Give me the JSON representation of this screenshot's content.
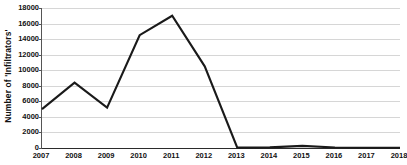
{
  "chart_data": {
    "type": "line",
    "title": "",
    "xlabel": "",
    "ylabel": "Number of 'Infiltrators'",
    "categories": [
      "2007",
      "2008",
      "2009",
      "2010",
      "2011",
      "2012",
      "2013",
      "2014",
      "2015",
      "2016",
      "2017",
      "2018"
    ],
    "values": [
      5000,
      8400,
      5200,
      14500,
      17000,
      10500,
      50,
      80,
      270,
      60,
      30,
      30
    ],
    "series": [
      {
        "name": "Number of 'Infiltrators'",
        "values": [
          5000,
          8400,
          5200,
          14500,
          17000,
          10500,
          50,
          80,
          270,
          60,
          30,
          30
        ]
      }
    ],
    "ylim": [
      0,
      18000
    ],
    "ytick_values": [
      0,
      2000,
      4000,
      6000,
      8000,
      10000,
      12000,
      14000,
      16000,
      18000
    ],
    "ytick_labels": [
      "0",
      "2000",
      "4000",
      "6000",
      "8000",
      "10000",
      "12000",
      "14000",
      "16000",
      "18000"
    ],
    "grid": true,
    "grid_axis": "y",
    "legend": false,
    "legend_position": "none",
    "line_color": "#1a1a1a",
    "grid_color": "#d6d6d6",
    "axis_color": "#2b2b2b",
    "background_color": "#ffffff",
    "markers": false
  }
}
